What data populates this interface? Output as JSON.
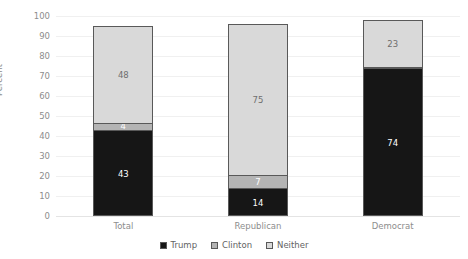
{
  "chart_data": {
    "type": "bar",
    "subtype": "stacked-bar",
    "title": "",
    "xlabel": "",
    "ylabel": "Percent",
    "ylim": [
      0,
      100
    ],
    "ytick_step": 10,
    "yticks": [
      "100",
      "90",
      "80",
      "70",
      "60",
      "50",
      "40",
      "30",
      "20",
      "10",
      "0"
    ],
    "grid": true,
    "legend_position": "bottom",
    "categories": [
      "Total",
      "Republican",
      "Democrat"
    ],
    "series": [
      {
        "name": "Trump",
        "color": "#161616",
        "values": [
          43,
          14,
          74
        ]
      },
      {
        "name": "Clinton",
        "color": "#b4b4b4",
        "values": [
          4,
          7,
          1
        ]
      },
      {
        "name": "Neither",
        "color": "#d9d9d9",
        "values": [
          48,
          75,
          23
        ]
      }
    ],
    "stack_totals": [
      95,
      96,
      98
    ],
    "bars": [
      {
        "category": "Total",
        "total": 95,
        "segments": [
          {
            "series": "Neither",
            "value": 48,
            "label": "48",
            "label_color": "#6e6e6e"
          },
          {
            "series": "Clinton",
            "value": 4,
            "label": "4",
            "label_color": "#ffffff"
          },
          {
            "series": "Trump",
            "value": 43,
            "label": "43",
            "label_color": "#ffffff"
          }
        ]
      },
      {
        "category": "Republican",
        "total": 96,
        "segments": [
          {
            "series": "Neither",
            "value": 75,
            "label": "75",
            "label_color": "#6e6e6e"
          },
          {
            "series": "Clinton",
            "value": 7,
            "label": "7",
            "label_color": "#ffffff"
          },
          {
            "series": "Trump",
            "value": 14,
            "label": "14",
            "label_color": "#ffffff"
          }
        ]
      },
      {
        "category": "Democrat",
        "total": 98,
        "segments": [
          {
            "series": "Neither",
            "value": 23,
            "label": "23",
            "label_color": "#6e6e6e"
          },
          {
            "series": "Clinton",
            "value": 1,
            "label": "1",
            "label_color": "#ffffff"
          },
          {
            "series": "Trump",
            "value": 74,
            "label": "74",
            "label_color": "#ffffff"
          }
        ]
      }
    ],
    "legend": [
      {
        "label": "Trump",
        "color": "#161616"
      },
      {
        "label": "Clinton",
        "color": "#b4b4b4"
      },
      {
        "label": "Neither",
        "color": "#d9d9d9"
      }
    ],
    "colors": {
      "background": "#ffffff",
      "gridline": "#f0f0f0",
      "axis_text": "#8d8d8d",
      "bar_outline": "#595959",
      "legend_text": "#636363"
    }
  }
}
